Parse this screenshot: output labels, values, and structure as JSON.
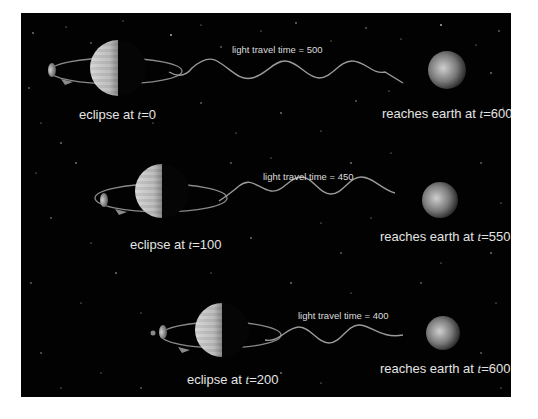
{
  "rows": [
    {
      "light_travel_label": "light travel time = 500",
      "eclipse_prefix": "eclipse at ",
      "eclipse_var": "t",
      "eclipse_value": "=0",
      "reach_prefix": "reaches earth at ",
      "reach_var": "t",
      "reach_value": "=600"
    },
    {
      "light_travel_label": "light travel time = 450",
      "eclipse_prefix": "eclipse at ",
      "eclipse_var": "t",
      "eclipse_value": "=100",
      "reach_prefix": "reaches earth at ",
      "reach_var": "t",
      "reach_value": "=550"
    },
    {
      "light_travel_label": "light travel time = 400",
      "eclipse_prefix": "eclipse at ",
      "eclipse_var": "t",
      "eclipse_value": "=200",
      "reach_prefix": "reaches earth at ",
      "reach_var": "t",
      "reach_value": "=600"
    }
  ],
  "colors": {
    "background": "#020202",
    "text": "#e4e4e4",
    "wave": "#9a9a9a",
    "orbit": "#8a8a8a"
  }
}
